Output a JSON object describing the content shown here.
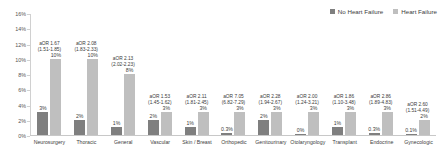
{
  "legend": {
    "entries": [
      {
        "label": "No Heart Failure",
        "color": "#7f7f7f"
      },
      {
        "label": "Heart Failure",
        "color": "#bfbfbf"
      }
    ]
  },
  "chart_data": {
    "type": "bar",
    "title": "",
    "xlabel": "",
    "ylabel": "",
    "ylim": [
      0,
      16
    ],
    "ytick_labels": [
      "16%",
      "14%",
      "12%",
      "10%",
      "8%",
      "6%",
      "4%",
      "2%",
      "0%"
    ],
    "ytick_values": [
      16,
      14,
      12,
      10,
      8,
      6,
      4,
      2,
      0
    ],
    "grid": false,
    "legend_position": "top-right",
    "categories": [
      "Neurosurgery",
      "Thoracic",
      "General",
      "Vascular",
      "Skin / Breast",
      "Orthopedic",
      "Genitourinary",
      "Otolaryngology",
      "Transplant",
      "Endocrine",
      "Gynecologic"
    ],
    "series": [
      {
        "name": "No Heart Failure",
        "color": "#7f7f7f",
        "values": [
          3,
          2,
          1,
          2,
          1,
          0.3,
          2,
          0.0,
          1,
          0.3,
          0.1
        ],
        "labels": [
          "3%",
          "2%",
          "1%",
          "2%",
          "1%",
          "0.3%",
          "2%",
          "0%",
          "1%",
          "0.3%",
          "0.1%"
        ]
      },
      {
        "name": "Heart Failure",
        "color": "#bfbfbf",
        "values": [
          10,
          10,
          8,
          3,
          3,
          3,
          3,
          3,
          3,
          3,
          2
        ],
        "labels": [
          "10%",
          "10%",
          "8%",
          "3%",
          "3%",
          "3%",
          "3%",
          "3%",
          "3%",
          "3%",
          "2%"
        ]
      }
    ],
    "annotations": [
      {
        "category": "Neurosurgery",
        "or_label": "aOR 1.67",
        "ci_label": "(1.51-1.85)"
      },
      {
        "category": "Thoracic",
        "or_label": "aOR 2.08",
        "ci_label": "(1.83-2.33)"
      },
      {
        "category": "General",
        "or_label": "aOR 2.13",
        "ci_label": "(2.02-2.23)"
      },
      {
        "category": "Vascular",
        "or_label": "aOR 1.53",
        "ci_label": "(1.45-1.62)"
      },
      {
        "category": "Skin / Breast",
        "or_label": "aOR 2.11",
        "ci_label": "(1.81-2.45)"
      },
      {
        "category": "Orthopedic",
        "or_label": "aOR 7.05",
        "ci_label": "(6.82-7.29)"
      },
      {
        "category": "Genitourinary",
        "or_label": "aOR 2.28",
        "ci_label": "(1.94-2.67)"
      },
      {
        "category": "Otolaryngology",
        "or_label": "aOR 2.00",
        "ci_label": "(1.24-3.21)"
      },
      {
        "category": "Transplant",
        "or_label": "aOR 1.86",
        "ci_label": "(1.10-3.48)"
      },
      {
        "category": "Endocrine",
        "or_label": "aOR 2.86",
        "ci_label": "(1.89-4.83)"
      },
      {
        "category": "Gynecologic",
        "or_label": "aOR 2.60",
        "ci_label": "(1.51-4.49)"
      }
    ]
  }
}
